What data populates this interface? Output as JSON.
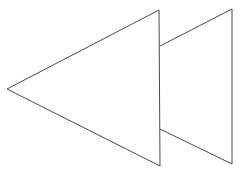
{
  "figure": {
    "icon": "rewind-icon",
    "stroke_color": "#4a4a4a",
    "fill_color": "#ffffff",
    "background": "#ffffff",
    "shapes": [
      {
        "name": "front-triangle",
        "points": "7,89 159,10 160,166"
      },
      {
        "name": "back-triangle",
        "points": "160,46 232,9 232,164 160,129"
      }
    ]
  }
}
